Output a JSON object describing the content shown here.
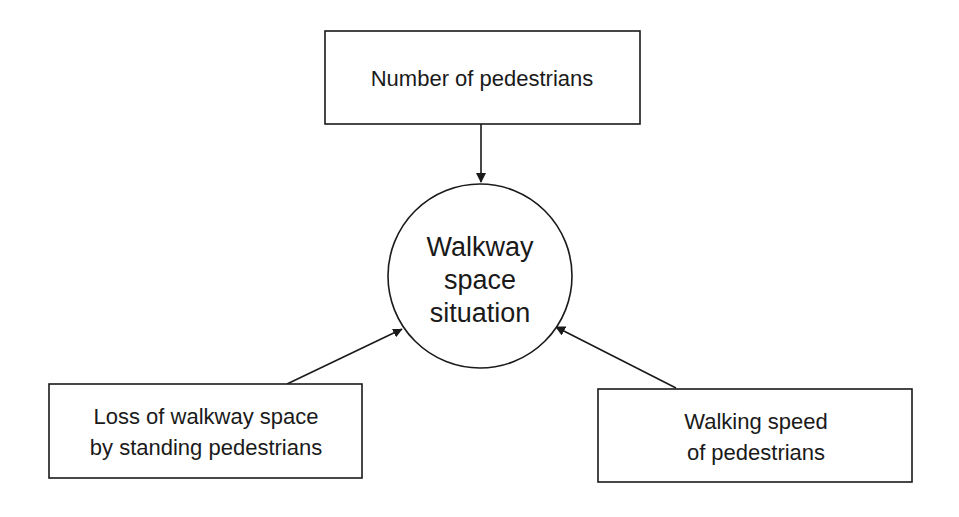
{
  "diagram": {
    "center": {
      "id": "walkway-space-situation",
      "lines": [
        "Walkway",
        "space",
        "situation"
      ]
    },
    "factors": [
      {
        "id": "number-of-pedestrians",
        "lines": [
          "Number of pedestrians"
        ]
      },
      {
        "id": "loss-of-walkway-space",
        "lines": [
          "Loss of walkway space",
          "by standing pedestrians"
        ]
      },
      {
        "id": "walking-speed",
        "lines": [
          "Walking speed",
          "of pedestrians"
        ]
      }
    ],
    "edges": [
      {
        "from": "number-of-pedestrians",
        "to": "walkway-space-situation"
      },
      {
        "from": "loss-of-walkway-space",
        "to": "walkway-space-situation"
      },
      {
        "from": "walking-speed",
        "to": "walkway-space-situation"
      }
    ],
    "colors": {
      "stroke": "#1a1a1a",
      "background": "#ffffff"
    }
  }
}
